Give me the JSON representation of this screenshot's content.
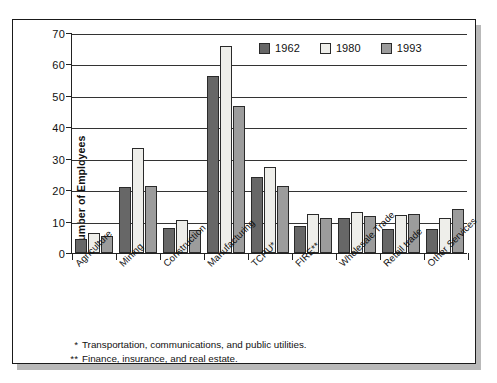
{
  "chart_data": {
    "type": "bar",
    "title": "",
    "subtitle": "",
    "xlabel": "",
    "ylabel": "Number of Employees",
    "ylim": [
      0,
      70
    ],
    "yticks": [
      0,
      10,
      20,
      30,
      40,
      50,
      60,
      70
    ],
    "grid": true,
    "legend_position": "top-right",
    "categories": [
      "Agriculture",
      "Mining",
      "Construction",
      "Manufacturing",
      "TCPU*",
      "FIRE**",
      "Wholesale Trade",
      "Retail trade",
      "Other Services"
    ],
    "series": [
      {
        "name": "1962",
        "color": "#676767",
        "values": [
          4.5,
          21.0,
          8.0,
          56.3,
          24.3,
          8.7,
          11.0,
          7.5,
          7.5
        ]
      },
      {
        "name": "1980",
        "color": "#eeeeea",
        "values": [
          6.3,
          33.3,
          10.5,
          66.0,
          27.5,
          12.3,
          13.2,
          12.0,
          11.3
        ]
      },
      {
        "name": "1993",
        "color": "#9c9c9c",
        "values": [
          5.5,
          21.2,
          7.4,
          46.8,
          21.2,
          11.2,
          11.8,
          12.4,
          14.0
        ]
      }
    ],
    "annotations": [
      {
        "mark": "*",
        "text": "Transportation, communications, and public utilities."
      },
      {
        "mark": "**",
        "text": "Finance, insurance, and real estate."
      }
    ]
  }
}
